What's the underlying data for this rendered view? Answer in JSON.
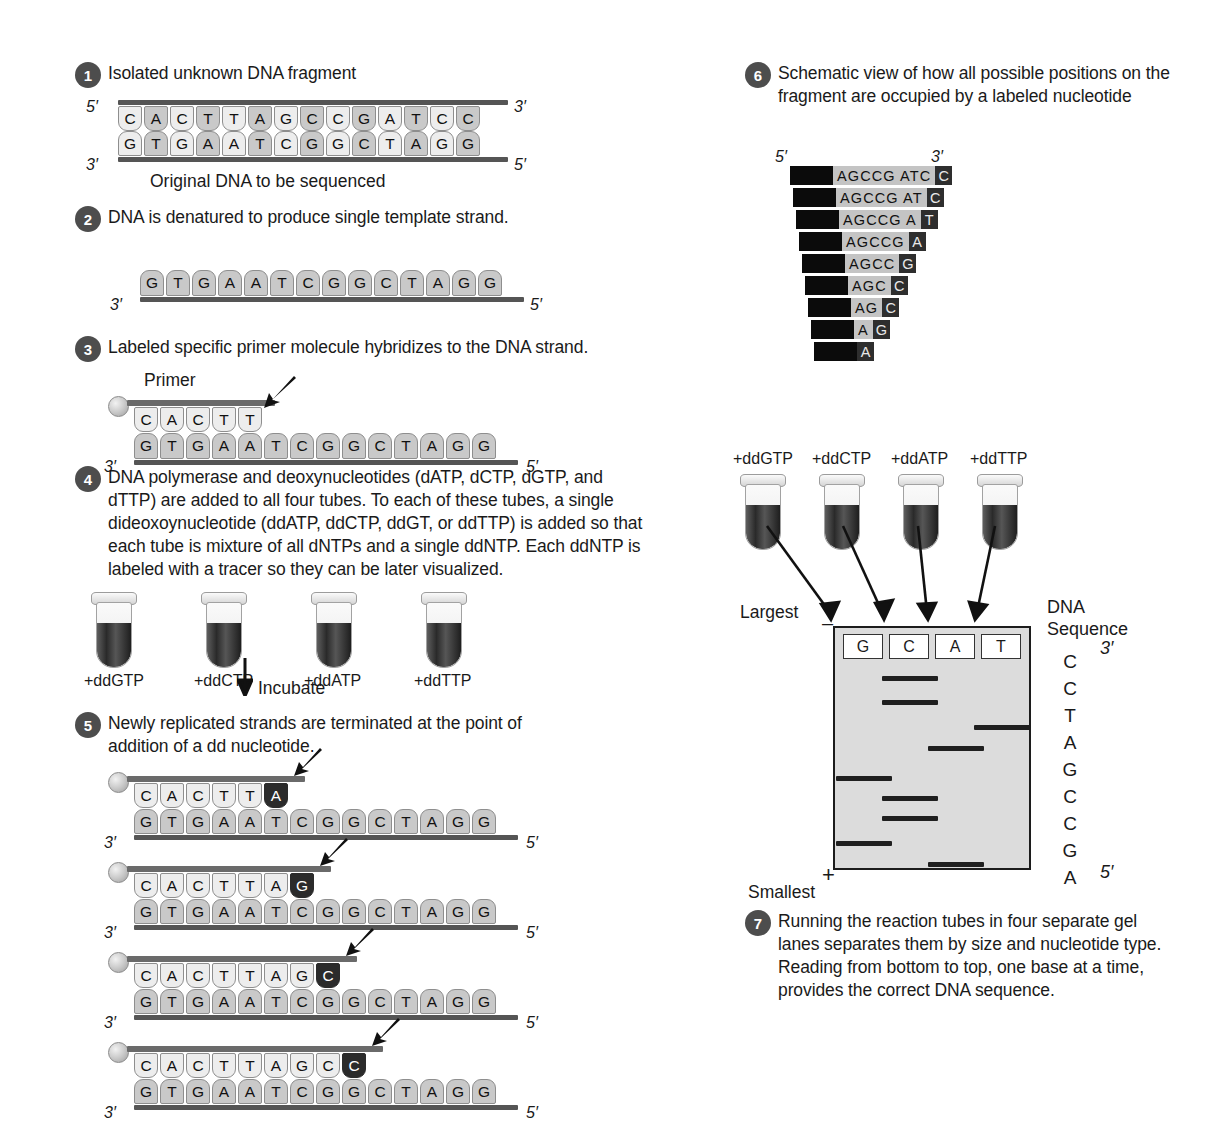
{
  "figure": {
    "colors": {
      "badge": "#4d4d4d",
      "base_fill": "#c9c9c9",
      "terminator": "#2b2b2b",
      "gel_bg": "#dcdcdc",
      "rail": "#555555"
    }
  },
  "steps": [
    {
      "number": "1",
      "text": "Isolated unknown DNA fragment",
      "caption": "Original DNA to be sequenced",
      "top_strand": [
        "C",
        "A",
        "C",
        "T",
        "T",
        "A",
        "G",
        "C",
        "C",
        "G",
        "A",
        "T",
        "C",
        "C"
      ],
      "bottom_strand": [
        "G",
        "T",
        "G",
        "A",
        "A",
        "T",
        "C",
        "G",
        "G",
        "C",
        "T",
        "A",
        "G",
        "G"
      ],
      "left_top_label": "5′",
      "right_top_label": "3′",
      "left_bottom_label": "3′",
      "right_bottom_label": "5′"
    },
    {
      "number": "2",
      "text": "DNA is denatured to produce single template strand.",
      "template_strand": [
        "G",
        "T",
        "G",
        "A",
        "A",
        "T",
        "C",
        "G",
        "G",
        "C",
        "T",
        "A",
        "G",
        "G"
      ],
      "left_label": "3′",
      "right_label": "5′"
    },
    {
      "number": "3",
      "text": "Labeled specific primer molecule hybridizes to the DNA strand.",
      "primer_label": "Primer",
      "primer": [
        "C",
        "A",
        "C",
        "T",
        "T"
      ],
      "template_strand": [
        "G",
        "T",
        "G",
        "A",
        "A",
        "T",
        "C",
        "G",
        "G",
        "C",
        "T",
        "A",
        "G",
        "G"
      ],
      "left_label": "3′",
      "right_label": "5′"
    },
    {
      "number": "4",
      "text": "DNA polymerase and deoxynucleotides (dATP, dCTP, dGTP, and dTTP) are added to all four tubes. To each of these tubes, a single dideoxoynucleotide (ddATP, ddCTP, ddGT, or ddTTP) is added so that each tube is mixture of all dNTPs and a single ddNTP. Each ddNTP is labeled with a tracer so they can be later visualized.",
      "tubes": [
        "+ddGTP",
        "+ddCTP",
        "+ddATP",
        "+ddTTP"
      ],
      "incubate_label": "Incubate"
    },
    {
      "number": "5",
      "text": "Newly replicated strands are terminated at the point of addition of a dd nucleotide.",
      "template_strand": [
        "G",
        "T",
        "G",
        "A",
        "A",
        "T",
        "C",
        "G",
        "G",
        "C",
        "T",
        "A",
        "G",
        "G"
      ],
      "left_label": "3′",
      "right_label": "5′",
      "strands": [
        {
          "bases": [
            "C",
            "A",
            "C",
            "T",
            "T"
          ],
          "terminator": "A"
        },
        {
          "bases": [
            "C",
            "A",
            "C",
            "T",
            "T",
            "A"
          ],
          "terminator": "G"
        },
        {
          "bases": [
            "C",
            "A",
            "C",
            "T",
            "T",
            "A",
            "G"
          ],
          "terminator": "C"
        },
        {
          "bases": [
            "C",
            "A",
            "C",
            "T",
            "T",
            "A",
            "G",
            "C"
          ],
          "terminator": "C"
        }
      ]
    },
    {
      "number": "6",
      "text": "Schematic view of how all possible positions on the fragment are occupied by a labeled nucleotide",
      "left_label": "5′",
      "right_label": "3′",
      "ladder": [
        {
          "seq": "AGCCG ATC",
          "last": "C"
        },
        {
          "seq": "AGCCG AT",
          "last": "C"
        },
        {
          "seq": "AGCCG A",
          "last": "T"
        },
        {
          "seq": "AGCCG",
          "last": "A"
        },
        {
          "seq": "AGCC",
          "last": "G"
        },
        {
          "seq": "AGC",
          "last": "C"
        },
        {
          "seq": "AG",
          "last": "C"
        },
        {
          "seq": "A",
          "last": "G"
        },
        {
          "seq": "",
          "last": "A"
        }
      ]
    },
    {
      "number": "7",
      "text": "Running the reaction tubes in four separate gel lanes separates them by size and nucleotide type. Reading from bottom to top, one base at a time, provides the correct DNA sequence."
    }
  ],
  "gel": {
    "tubes": [
      "+ddGTP",
      "+ddCTP",
      "+ddATP",
      "+ddTTP"
    ],
    "lanes": [
      "G",
      "C",
      "A",
      "T"
    ],
    "largest_label": "Largest",
    "smallest_label": "Smallest",
    "negative_pole": "–",
    "positive_pole": "+",
    "sequence_title_line1": "DNA",
    "sequence_title_line2": "Sequence",
    "sequence_top_label": "3′",
    "sequence_bottom_label": "5′",
    "read_sequence": [
      "C",
      "C",
      "T",
      "A",
      "G",
      "C",
      "C",
      "G",
      "A"
    ],
    "bands": [
      {
        "lane": "C",
        "position": 1
      },
      {
        "lane": "C",
        "position": 2
      },
      {
        "lane": "T",
        "position": 3
      },
      {
        "lane": "A",
        "position": 4
      },
      {
        "lane": "G",
        "position": 5
      },
      {
        "lane": "C",
        "position": 6
      },
      {
        "lane": "C",
        "position": 7
      },
      {
        "lane": "G",
        "position": 8
      },
      {
        "lane": "A",
        "position": 9
      }
    ]
  }
}
